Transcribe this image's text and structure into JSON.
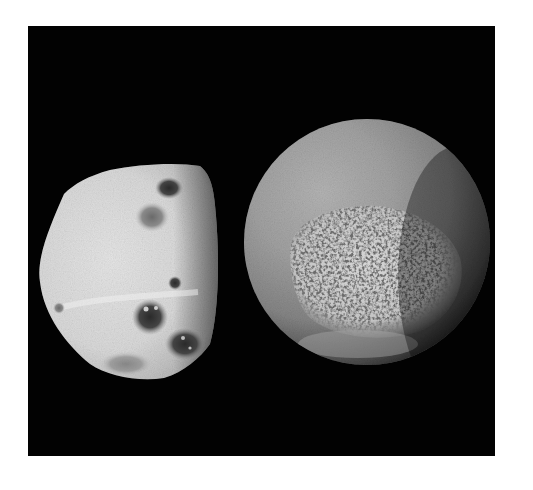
{
  "image": {
    "kind": "photograph",
    "colorMode": "grayscale",
    "background": "#020202",
    "pageBackground": "#ffffff",
    "subjects": [
      {
        "name": "moldy-cheese-block",
        "description": "Irregular block of white cheese with dark mold spots",
        "tone": "#d8d8d8",
        "moldSpots": 7
      },
      {
        "name": "moldy-orange",
        "description": "Round citrus fruit with a large white powdery mold patch",
        "tone": "#8e8e8e",
        "moldPatchTone": "#d0d0d0"
      }
    ]
  }
}
